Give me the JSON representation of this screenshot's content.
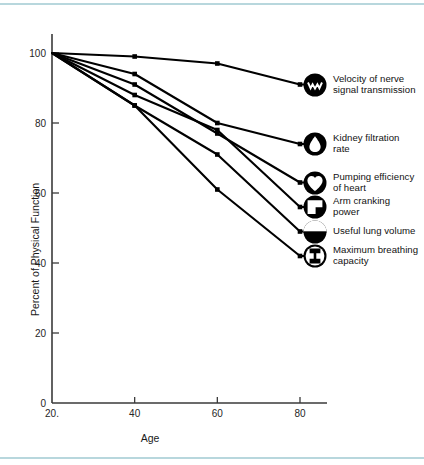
{
  "figure": {
    "background_color": "#ffffff",
    "rule_color": "#b8d7dd",
    "line_color": "#000000"
  },
  "chart_data": {
    "type": "line",
    "title": "",
    "xlabel": "Age",
    "ylabel": "Percent of Physical Function",
    "x": [
      20,
      40,
      60,
      80
    ],
    "xlim": [
      20,
      88
    ],
    "ylim": [
      0,
      104
    ],
    "xticks": [
      20,
      40,
      60,
      80
    ],
    "xtick_labels": [
      "20.",
      "40",
      "60",
      "80"
    ],
    "yticks": [
      0,
      20,
      40,
      60,
      80,
      100
    ],
    "ytick_labels": [
      "0",
      "20",
      "40",
      "60",
      "80",
      "100"
    ],
    "grid": false,
    "legend_position": "right-inline-at-line-ends",
    "marker": "square-dot",
    "series": [
      {
        "name": "Velocity of nerve signal transmission",
        "label_lines": [
          "Velocity of nerve",
          "signal transmission"
        ],
        "icon": "nerve-signal-icon",
        "values": [
          100,
          99,
          97,
          91
        ]
      },
      {
        "name": "Kidney filtration rate",
        "label_lines": [
          "Kidney filtration",
          "rate"
        ],
        "icon": "kidney-droplet-icon",
        "values": [
          100,
          94,
          80,
          74
        ]
      },
      {
        "name": "Pumping efficiency of heart",
        "label_lines": [
          "Pumping efficiency",
          "of heart"
        ],
        "icon": "heart-icon",
        "values": [
          100,
          91,
          77,
          63
        ]
      },
      {
        "name": "Arm cranking power",
        "label_lines": [
          "Arm cranking",
          "power"
        ],
        "icon": "arm-crank-icon",
        "values": [
          100,
          88,
          78,
          56
        ]
      },
      {
        "name": "Useful lung volume",
        "label_lines": [
          "Useful lung volume"
        ],
        "icon": "lung-volume-icon",
        "values": [
          100,
          85,
          71,
          49
        ]
      },
      {
        "name": "Maximum breathing capacity",
        "label_lines": [
          "Maximum breathing",
          "capacity"
        ],
        "icon": "breathing-capacity-icon",
        "values": [
          100,
          85,
          61,
          42
        ]
      }
    ]
  }
}
